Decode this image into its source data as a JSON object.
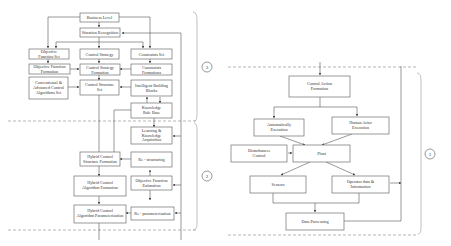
{
  "left_diagram": {
    "boxes": {
      "business_level": "Business Level",
      "situation_recognition": "Situation Recognition",
      "objective_function_set_1": "Objective",
      "objective_function_set_2": "Function Set",
      "control_strategy": "Control Strategy",
      "constraints_set": "Constraints Set",
      "objective_function_formation_1": "Objective Function",
      "objective_function_formation_2": "Formation",
      "control_strategy_formation_1": "Control Strategy",
      "control_strategy_formation_2": "Formation",
      "constraints_formations_1": "Constraints",
      "constraints_formations_2": "Formations",
      "conventional_1": "Conventional &",
      "conventional_2": "Advanced Control",
      "conventional_3": "Algorithms Set",
      "control_structure_set_1": "Control Structure",
      "control_structure_set_2": "Set",
      "intelligent_building_blocks_1": "Intelligent Building",
      "intelligent_building_blocks_2": "Blocks",
      "knowledge_rule_base_1": "Knowledge",
      "knowledge_rule_base_2": "Rule Base",
      "learning_1": "Learning &",
      "learning_2": "Knowledge",
      "learning_3": "Acquisition",
      "hybrid_structure_1": "Hybrid Control",
      "hybrid_structure_2": "Structure Formation",
      "restructuring": "Re - structuring",
      "hybrid_algorithm_1": "Hybrid Control",
      "hybrid_algorithm_2": "Algorithm Formation",
      "objective_estimation_1": "Objective Function",
      "objective_estimation_2": "Estimation",
      "hybrid_param_1": "Hybrid Control",
      "hybrid_param_2": "Algorithm Parameterization",
      "reparam": "Re - parameterization"
    },
    "level_labels": [
      "3",
      "2"
    ]
  },
  "right_diagram": {
    "boxes": {
      "control_action_1": "Control Action",
      "control_action_2": "Formation",
      "auto_exec_1": "Automatically",
      "auto_exec_2": "Execution",
      "human_exec_1": "Human Actor",
      "human_exec_2": "Execution",
      "disturbances_1": "Disturbances",
      "disturbances_2": "Control",
      "plant": "Plant",
      "sensors": "Sensors",
      "operator_1": "Operator data &",
      "operator_2": "Information",
      "data_processing": "Data Processing"
    },
    "level_labels": [
      "1"
    ]
  }
}
